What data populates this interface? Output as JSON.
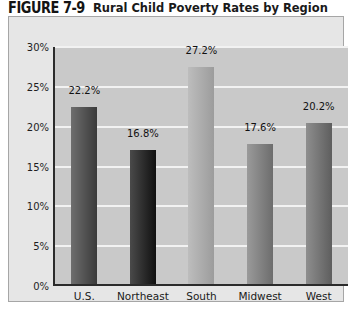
{
  "title": {
    "number": "FIGURE 7-9",
    "caption": "Rural Child Poverty Rates by Region"
  },
  "colors": {
    "frame_background": "#e6e6e6",
    "frame_border": "#a6a6a6",
    "plot_background": "#c9c9c9",
    "gridline": "#f2f2f2",
    "axis": "#2b2b2b",
    "text": "#1a1a1a"
  },
  "chart_data": {
    "type": "bar",
    "title": "Rural Child Poverty Rates by Region",
    "xlabel": "",
    "ylabel": "",
    "ylim": [
      0,
      30
    ],
    "ytick_labels": [
      "0%",
      "5%",
      "10%",
      "15%",
      "20%",
      "25%",
      "30%"
    ],
    "ytick_values": [
      0,
      5,
      10,
      15,
      20,
      25,
      30
    ],
    "grid": true,
    "legend": "none",
    "categories": [
      "U.S.",
      "Northeast",
      "South",
      "Midwest",
      "West"
    ],
    "values": [
      22.2,
      16.8,
      27.2,
      17.6,
      20.2
    ],
    "value_labels": [
      "22.2%",
      "16.8%",
      "27.2%",
      "17.6%",
      "20.2%"
    ],
    "bar_colors_left": [
      "#6e6e6e",
      "#4a4a4a",
      "#bdbdbd",
      "#9a9a9a",
      "#8e8e8e"
    ],
    "bar_colors_right": [
      "#3a3a3a",
      "#101010",
      "#9c9c9c",
      "#6d6d6d",
      "#5e5e5e"
    ]
  }
}
